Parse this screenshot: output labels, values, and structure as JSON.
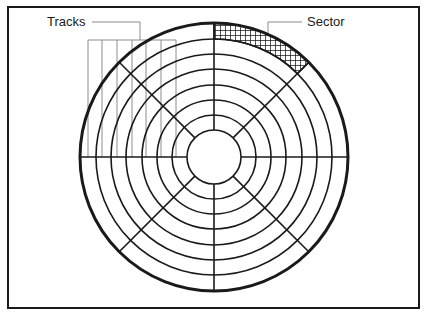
{
  "figure": {
    "background_color": "#ffffff",
    "line_color": "#1a1a1a",
    "leader_color": "#8c8c8c",
    "border": {
      "name": "figure-border",
      "x": 8,
      "y": 7,
      "width": 411,
      "height": 301,
      "stroke_width": 2
    }
  },
  "labels": {
    "tracks": {
      "text": "Tracks",
      "x": 47,
      "y": 26
    },
    "sector": {
      "text": "Sector",
      "x": 307,
      "y": 26
    }
  },
  "diagram": {
    "center": {
      "x": 214,
      "y": 157
    },
    "outer_radius": 134,
    "hub_radius": 27,
    "ring_count": 8,
    "ring_radii": [
      27,
      42,
      57,
      72,
      88,
      103,
      118,
      134
    ],
    "spoke_count": 8,
    "spoke_angles_deg": [
      0,
      45,
      90,
      135,
      180,
      225,
      270,
      315
    ],
    "outer_stroke_width": 3,
    "ring_stroke_width": 1.6,
    "spoke_stroke_width": 1.6
  },
  "sector_highlight": {
    "name": "highlighted-sector",
    "start_angle_deg": 0,
    "end_angle_deg": 45,
    "inner_radius": 118,
    "outer_radius": 134,
    "fill_pattern": "cross-hatch-mesh"
  },
  "tracks_leader": {
    "label_line": {
      "x1": 92,
      "y1": 22,
      "x2": 140,
      "y2": 22
    },
    "drop_line": {
      "x1": 140,
      "y1": 22,
      "x2": 140,
      "y2": 40
    },
    "comb_bar": {
      "x1": 88,
      "y1": 40,
      "x2": 176,
      "y2": 40
    },
    "comb_bottom_y": 157,
    "comb_tick_x": [
      88,
      102,
      117,
      132,
      146,
      161,
      176
    ]
  },
  "sector_leader": {
    "label_line": {
      "x1": 268,
      "y1": 22,
      "x2": 302,
      "y2": 22
    },
    "drop_line": {
      "x1": 268,
      "y1": 22,
      "x2": 268,
      "y2": 52
    }
  }
}
